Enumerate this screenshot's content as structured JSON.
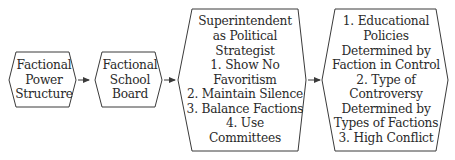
{
  "diagram": {
    "type": "flow",
    "direction": "left-to-right",
    "stroke_color": "#3a3a3a",
    "nodes": [
      {
        "id": "factional-power-structure",
        "lines": [
          "Factional",
          "Power",
          "Structure"
        ]
      },
      {
        "id": "factional-school-board",
        "lines": [
          "Factional",
          "School",
          "Board"
        ]
      },
      {
        "id": "superintendent-political-strategist",
        "lines": [
          "Superintendent",
          "as Political",
          "Strategist",
          "1. Show No",
          "Favoritism",
          "2. Maintain Silence",
          "3. Balance Factions",
          "4. Use",
          "Committees"
        ]
      },
      {
        "id": "outcomes",
        "lines": [
          "1. Educational",
          "Policies",
          "Determined by",
          "Faction in Control",
          "2. Type of",
          "Controversy",
          "Determined by",
          "Types of Factions",
          "3. High Conflict"
        ]
      }
    ],
    "edges": [
      {
        "from": "factional-power-structure",
        "to": "factional-school-board"
      },
      {
        "from": "factional-school-board",
        "to": "superintendent-political-strategist"
      },
      {
        "from": "superintendent-political-strategist",
        "to": "outcomes"
      }
    ]
  }
}
